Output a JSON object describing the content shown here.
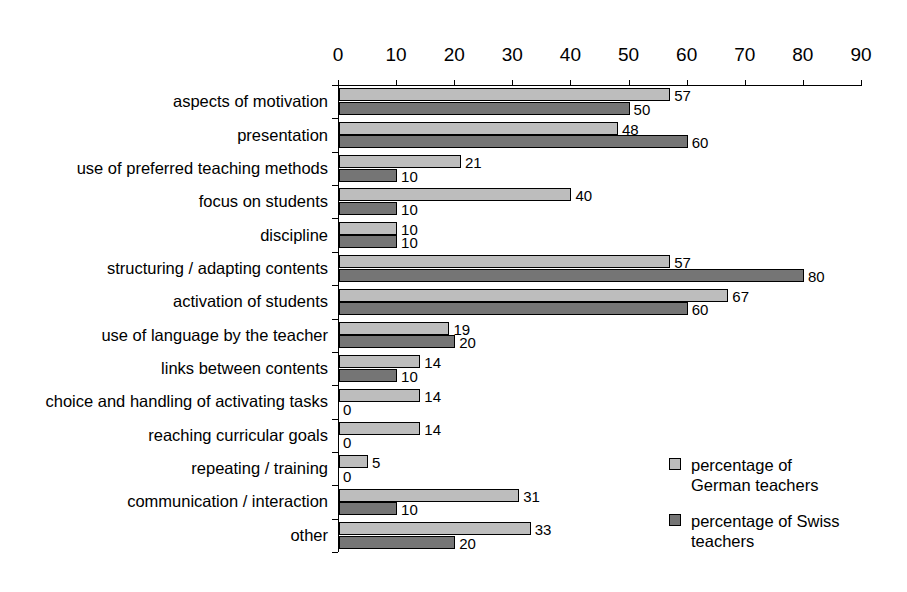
{
  "chart_data": {
    "type": "bar",
    "orientation": "horizontal",
    "title": "",
    "subtitle": "",
    "xlabel": "",
    "ylabel": "",
    "xlim": [
      0,
      90
    ],
    "xticks": [
      0,
      10,
      20,
      30,
      40,
      50,
      60,
      70,
      80,
      90
    ],
    "grid": false,
    "legend_position": "bottom-right",
    "axis_position": "top",
    "categories": [
      "aspects of motivation",
      "presentation",
      "use of preferred teaching methods",
      "focus on students",
      "discipline",
      "structuring / adapting contents",
      "activation of students",
      "use of language by the teacher",
      "links between contents",
      "choice and handling of activating tasks",
      "reaching curricular goals",
      "repeating / training",
      "communication / interaction",
      "other"
    ],
    "series": [
      {
        "name": "percentage of German teachers",
        "color": "#bdbdbd",
        "values": [
          57,
          48,
          21,
          40,
          10,
          57,
          67,
          19,
          14,
          14,
          14,
          5,
          31,
          33
        ]
      },
      {
        "name": "percentage of Swiss teachers",
        "color": "#757575",
        "values": [
          50,
          60,
          10,
          10,
          10,
          80,
          60,
          20,
          10,
          0,
          0,
          0,
          10,
          20
        ]
      }
    ],
    "data_labels": [
      {
        "category": "aspects of motivation",
        "german": "57",
        "swiss": "50"
      },
      {
        "category": "presentation",
        "german": "48",
        "swiss": "60"
      },
      {
        "category": "use of preferred teaching methods",
        "german": "21",
        "swiss": "10"
      },
      {
        "category": "focus on students",
        "german": "40",
        "swiss": "10"
      },
      {
        "category": "discipline",
        "german": "10",
        "swiss": "10"
      },
      {
        "category": "structuring / adapting contents",
        "german": "57",
        "swiss": "80"
      },
      {
        "category": "activation of students",
        "german": "67",
        "swiss": "60"
      },
      {
        "category": "use of language by the teacher",
        "german": "19",
        "swiss": "20"
      },
      {
        "category": "links between contents",
        "german": "14",
        "swiss": "10"
      },
      {
        "category": "choice and handling of activating tasks",
        "german": "14",
        "swiss": "0"
      },
      {
        "category": "reaching curricular goals",
        "german": "14",
        "swiss": "0"
      },
      {
        "category": "repeating / training",
        "german": "5",
        "swiss": "0"
      },
      {
        "category": "communication / interaction",
        "german": "31",
        "swiss": "10"
      },
      {
        "category": "other",
        "german": "33",
        "swiss": "20"
      }
    ]
  },
  "legend": {
    "items": [
      {
        "label_line1": "percentage of",
        "label_line2": "German teachers",
        "swatch": "series-german"
      },
      {
        "label_line1": "percentage of Swiss",
        "label_line2": "teachers",
        "swatch": "series-swiss"
      }
    ]
  },
  "colors": {
    "german": "#bdbdbd",
    "swiss": "#757575",
    "axis": "#000000",
    "background": "#ffffff"
  }
}
